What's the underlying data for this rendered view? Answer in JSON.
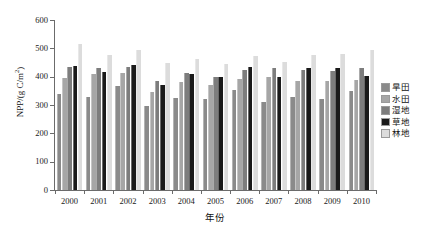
{
  "chart_data": {
    "type": "bar",
    "title": "",
    "subtitle": "",
    "xlabel": "年份",
    "ylabel": "NPP/(g C/m²)",
    "ylabel_base": "NPP/(g C/m",
    "ylabel_sup": "2",
    "ylabel_tail": ")",
    "categories": [
      "2000",
      "2001",
      "2002",
      "2003",
      "2004",
      "2005",
      "2006",
      "2007",
      "2008",
      "2009",
      "2010"
    ],
    "ylim": [
      0,
      600
    ],
    "yticks": [
      0,
      100,
      200,
      300,
      400,
      500,
      600
    ],
    "ytick_labels": [
      "0",
      "100",
      "200",
      "300",
      "400",
      "500",
      "600"
    ],
    "grid": false,
    "legend_position": "right",
    "series": [
      {
        "name": "旱田",
        "color": "#8a8a8a",
        "values": [
          340,
          330,
          368,
          297,
          323,
          321,
          353,
          311,
          327,
          322,
          348
        ]
      },
      {
        "name": "水田",
        "color": "#a6a6a6",
        "values": [
          395,
          410,
          413,
          345,
          380,
          370,
          393,
          400,
          383,
          385,
          390
        ]
      },
      {
        "name": "湿地",
        "color": "#7d7d7d",
        "values": [
          435,
          430,
          435,
          385,
          412,
          398,
          423,
          432,
          425,
          420,
          430
        ]
      },
      {
        "name": "草地",
        "color": "#1a1a1a",
        "values": [
          438,
          417,
          442,
          370,
          410,
          398,
          434,
          398,
          432,
          429,
          403
        ]
      },
      {
        "name": "林地",
        "color": "#dcdcdc",
        "values": [
          517,
          477,
          495,
          447,
          463,
          446,
          472,
          452,
          477,
          481,
          493
        ]
      }
    ]
  }
}
